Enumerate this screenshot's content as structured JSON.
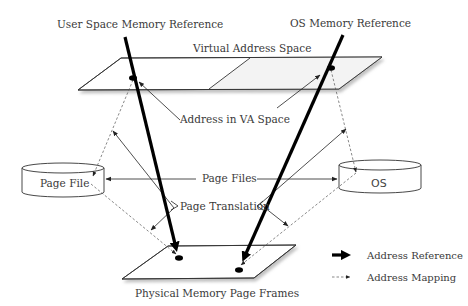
{
  "diagram": {
    "labels": {
      "user_ref": "User Space Memory Reference",
      "os_ref": "OS Memory Reference",
      "va_space": "Virtual Address Space",
      "addr_in_va": "Address in VA Space",
      "page_file": "Page File",
      "page_files": "Page Files",
      "os": "OS",
      "page_translation": "Page Translation",
      "physical": "Physical Memory Page Frames"
    },
    "legend": {
      "items": [
        {
          "label": "Address Reference",
          "style": "thick-solid-arrow"
        },
        {
          "label": "Address Mapping",
          "style": "dashed-arrow"
        }
      ]
    },
    "colors": {
      "stroke": "#222222",
      "text": "#3a3a3a",
      "plane_shadow": "#bdbdbd",
      "plane_shade": "#f3f3f3"
    }
  }
}
